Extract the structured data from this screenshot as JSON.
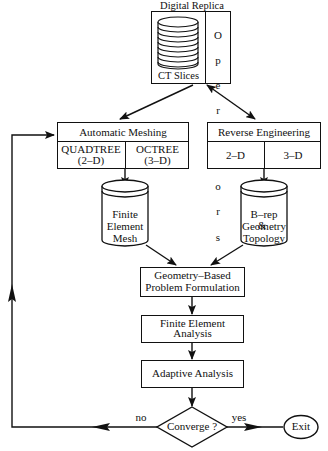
{
  "diagram": {
    "digital_replica": {
      "title": "Digital Replica",
      "left_label": "CT Slices",
      "right_label_chars": [
        "O",
        "p",
        "e",
        "r",
        "a",
        "t",
        "o",
        "r",
        "s"
      ],
      "right_label": "Operators"
    },
    "automatic_meshing": {
      "title": "Automatic Meshing",
      "left_line1": "QUADTREE",
      "left_line2": "(2–D)",
      "right_line1": "OCTREE",
      "right_line2": "(3–D)"
    },
    "reverse_engineering": {
      "title": "Reverse Engineering",
      "left": "2–D",
      "right": "3–D"
    },
    "fe_mesh_db": {
      "line1": "Finite",
      "line2": "Element",
      "line3": "Mesh"
    },
    "brep_db": {
      "line1": "B–rep",
      "line2a": "Geometry",
      "line2b": "&",
      "line3": "Topology"
    },
    "problem_formulation": {
      "line1": "Geometry–Based",
      "line2": "Problem  Formulation"
    },
    "fe_analysis": {
      "line1": "Finite  Element",
      "line2": "Analysis"
    },
    "adaptive_analysis": {
      "label": "Adaptive  Analysis"
    },
    "decision": {
      "label": "Converge ?",
      "no_label": "no",
      "yes_label": "yes"
    },
    "exit": {
      "label": "Exit"
    }
  },
  "colors": {
    "line": "#111111",
    "background": "#ffffff"
  }
}
